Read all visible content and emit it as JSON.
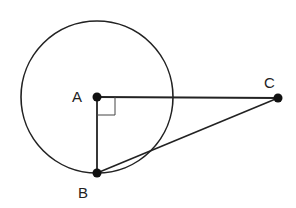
{
  "diagram": {
    "type": "geometry",
    "stroke_color": "#222222",
    "background": "#ffffff",
    "circle": {
      "center": "A",
      "cx": 97,
      "cy": 97,
      "r": 76
    },
    "points": [
      {
        "id": "A",
        "label": "A",
        "x": 97,
        "y": 97,
        "label_x": 72,
        "label_y": 102
      },
      {
        "id": "B",
        "label": "B",
        "x": 97,
        "y": 173,
        "label_x": 78,
        "label_y": 198
      },
      {
        "id": "C",
        "label": "C",
        "x": 278,
        "y": 98,
        "label_x": 264,
        "label_y": 88
      }
    ],
    "segments": [
      {
        "from": "A",
        "to": "C"
      },
      {
        "from": "A",
        "to": "B"
      },
      {
        "from": "B",
        "to": "C"
      }
    ],
    "right_angle": {
      "vertex": "A",
      "size": 18
    }
  }
}
